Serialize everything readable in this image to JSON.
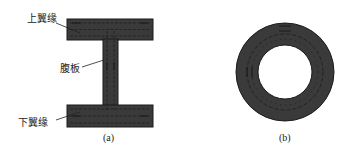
{
  "figure_a": {
    "caption": "(a)",
    "labels": {
      "top_flange": "上翼缘",
      "web": "腹板",
      "bottom_flange": "下翼缘"
    }
  },
  "figure_b": {
    "caption": "(b)"
  },
  "colors": {
    "fill": "#3a3a3a",
    "outline": "#1a1a1a",
    "flow_lines": "#1c1c1c",
    "background": "#ffffff"
  }
}
